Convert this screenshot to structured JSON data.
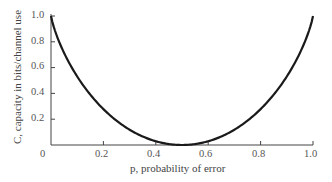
{
  "chart_data": {
    "type": "line",
    "title": "",
    "xlabel": "p, probability of error",
    "ylabel": "C, capacity in bits/channel use",
    "xlim": [
      0,
      1.0
    ],
    "ylim": [
      0,
      1.0
    ],
    "grid": false,
    "legend": null,
    "x_ticks": [
      "0",
      "0.2",
      "0.4",
      "0.6",
      "0.8",
      "1.0"
    ],
    "y_ticks": [
      "0.2",
      "0.4",
      "0.6",
      "0.8",
      "1.0"
    ],
    "series": [
      {
        "name": "C = 1 - H(p)",
        "x": [
          0.0,
          0.05,
          0.1,
          0.15,
          0.2,
          0.25,
          0.3,
          0.35,
          0.4,
          0.45,
          0.5,
          0.55,
          0.6,
          0.65,
          0.7,
          0.75,
          0.8,
          0.85,
          0.9,
          0.95,
          1.0
        ],
        "values": [
          1.0,
          0.714,
          0.531,
          0.39,
          0.278,
          0.189,
          0.119,
          0.066,
          0.029,
          0.007,
          0.0,
          0.007,
          0.029,
          0.066,
          0.119,
          0.189,
          0.278,
          0.39,
          0.531,
          0.714,
          1.0
        ]
      }
    ]
  },
  "labels": {
    "xlabel": "p, probability of error",
    "ylabel": "C, capacity in bits/channel use",
    "x0": "0",
    "x1": "0.2",
    "x2": "0.4",
    "x3": "0.6",
    "x4": "0.8",
    "x5": "1.0",
    "y1": "0.2",
    "y2": "0.4",
    "y3": "0.6",
    "y4": "0.8",
    "y5": "1.0"
  }
}
